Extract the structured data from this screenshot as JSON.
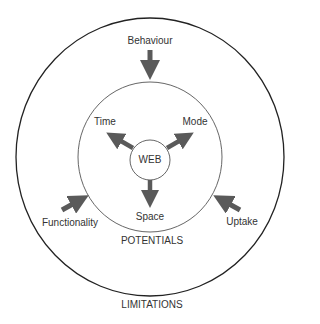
{
  "diagram": {
    "center": "WEB",
    "inner_outputs": [
      {
        "label": "Time",
        "direction": "upper-left"
      },
      {
        "label": "Mode",
        "direction": "upper-right"
      },
      {
        "label": "Space",
        "direction": "down"
      }
    ],
    "outer_inputs": [
      {
        "label": "Behaviour",
        "direction": "from-top"
      },
      {
        "label": "Functionality",
        "direction": "from-lower-left"
      },
      {
        "label": "Uptake",
        "direction": "from-lower-right"
      }
    ],
    "middle_ring_label": "POTENTIALS",
    "outer_ring_label": "LIMITATIONS"
  },
  "colors": {
    "arrow": "#5a5a5a",
    "outer_ring": "#222222",
    "middle_ring": "#555555",
    "text": "#333333"
  }
}
